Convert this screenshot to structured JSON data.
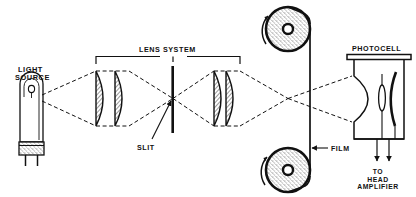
{
  "figure": {
    "type": "diagram",
    "width": 416,
    "height": 197,
    "ink_color": "#111111",
    "background_color": "#ffffff"
  },
  "labels": {
    "light_source_line1": "LIGHT",
    "light_source_line2": "SOURCE",
    "lens_system": "LENS SYSTEM",
    "slit": "SLIT",
    "film": "FILM",
    "photocell": "PHOTOCELL",
    "to_amp_line1": "TO",
    "to_amp_line2": "HEAD",
    "to_amp_line3": "AMPLIFIER"
  },
  "components": [
    {
      "name": "light-source-lamp",
      "label": "LIGHT SOURCE",
      "kind": "incandescent-exciter-lamp"
    },
    {
      "name": "condenser-lens-1",
      "label": "",
      "kind": "plano-convex-lens"
    },
    {
      "name": "condenser-lens-2",
      "label": "",
      "kind": "plano-convex-lens"
    },
    {
      "name": "slit-aperture",
      "label": "SLIT",
      "kind": "vertical-slit-bar"
    },
    {
      "name": "objective-lens-1",
      "label": "",
      "kind": "plano-convex-lens"
    },
    {
      "name": "objective-lens-2",
      "label": "",
      "kind": "plano-convex-lens"
    },
    {
      "name": "film-strip",
      "label": "FILM",
      "kind": "vertical-film-path"
    },
    {
      "name": "upper-film-reel",
      "label": "",
      "kind": "film-reel"
    },
    {
      "name": "lower-film-reel",
      "label": "",
      "kind": "film-reel"
    },
    {
      "name": "photocell-tube",
      "label": "PHOTOCELL",
      "kind": "photoelectric-cell"
    },
    {
      "name": "output-leads",
      "label": "TO HEAD AMPLIFIER",
      "kind": "wire-pair"
    }
  ],
  "annotations": {
    "lens_system_bracket_spans": "condenser-lens-1 through objective-lens-2",
    "slit_arrow_points_to": "slit-aperture",
    "film_arrow_points_to": "film-strip",
    "reel_rotation": "counter-clockwise"
  }
}
